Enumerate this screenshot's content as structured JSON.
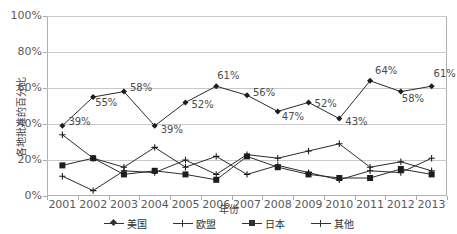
{
  "chart_data": {
    "type": "line",
    "title": "",
    "xlabel": "年份",
    "ylabel": "各地批准的百分比",
    "categories": [
      "2001",
      "2002",
      "2003",
      "2004",
      "2005",
      "2006",
      "2007",
      "2008",
      "2009",
      "2010",
      "2011",
      "2012",
      "2013"
    ],
    "ylim": [
      0,
      100
    ],
    "yticks": [
      "0%",
      "20%",
      "40%",
      "60%",
      "80%",
      "100%"
    ],
    "ytick_values": [
      0,
      20,
      40,
      60,
      80,
      100
    ],
    "grid": true,
    "legend_position": "bottom",
    "series": [
      {
        "name": "美国",
        "marker": "diamond",
        "values": [
          39,
          55,
          58,
          39,
          52,
          61,
          56,
          47,
          52,
          43,
          64,
          58,
          61
        ],
        "labels": [
          "39%",
          "55%",
          "58%",
          "39%",
          "52%",
          "61%",
          "56%",
          "47%",
          "52%",
          "43%",
          "64%",
          "58%",
          "61%"
        ]
      },
      {
        "name": "欧盟",
        "marker": "cross",
        "values": [
          11,
          3,
          14,
          13,
          20,
          12,
          23,
          21,
          25,
          29,
          16,
          19,
          14
        ]
      },
      {
        "name": "日本",
        "marker": "square",
        "values": [
          17,
          21,
          12,
          14,
          12,
          9,
          22,
          16,
          12,
          10,
          10,
          15,
          12
        ]
      },
      {
        "name": "其他",
        "marker": "cross",
        "values": [
          34,
          21,
          16,
          27,
          16,
          22,
          12,
          17,
          13,
          9,
          14,
          13,
          21
        ]
      }
    ]
  },
  "legend": {
    "items": [
      {
        "label": "美国"
      },
      {
        "label": "欧盟"
      },
      {
        "label": "日本"
      },
      {
        "label": "其他"
      }
    ]
  }
}
